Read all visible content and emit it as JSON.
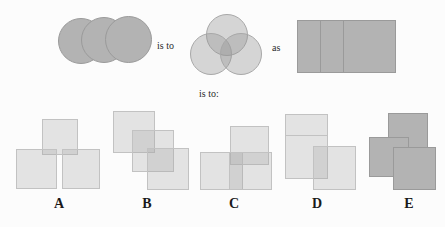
{
  "puzzle": {
    "kind": "visual-analogy",
    "connectives": {
      "is_to_1": "is to",
      "as": "as",
      "is_to_2": "is to:"
    },
    "colors": {
      "background": "#fcfcfc",
      "shape_opaque_fill": "#b3b3b3",
      "shape_opaque_stroke": "#9a9a9a",
      "shape_translucent_fill": "rgba(150,150,150,0.38)",
      "shape_translucent_stroke": "#a8a8a8",
      "shape_light_fill": "rgba(170,170,170,0.30)",
      "shape_light_stroke": "#c2c2c2",
      "label_text": "#1a1a1a",
      "word_text": "#2b2b2b"
    },
    "prompt": {
      "term_a": {
        "name": "three-opaque-overlapping-circles",
        "description": "Three solid gray circles overlapping left to right in a row",
        "shape": "circle",
        "count": 3,
        "style": "opaque",
        "arrangement": "horizontal-row-overlap"
      },
      "term_b": {
        "name": "three-translucent-venn-circles",
        "description": "Three translucent circles in a Venn diagram arrangement",
        "shape": "circle",
        "count": 3,
        "style": "translucent",
        "arrangement": "venn-triad"
      },
      "term_c": {
        "name": "three-opaque-overlapping-squares",
        "description": "Three solid gray squares overlapping left to right in a row",
        "shape": "square",
        "count": 3,
        "style": "opaque",
        "arrangement": "horizontal-row-overlap"
      }
    },
    "options": [
      {
        "label": "A",
        "name": "option-a",
        "description": "Three light squares: one centered above, two below left and right, corners overlapping",
        "shape": "square",
        "count": 3,
        "style": "light",
        "arrangement": "pyramid-triad"
      },
      {
        "label": "B",
        "name": "option-b",
        "description": "Three light squares cascading diagonally down to the right",
        "shape": "square",
        "count": 3,
        "style": "light",
        "arrangement": "diagonal-cascade"
      },
      {
        "label": "C",
        "name": "option-c",
        "description": "Three light squares: one raised upper right, two overlapping below",
        "shape": "square",
        "count": 3,
        "style": "light",
        "arrangement": "offset-cluster"
      },
      {
        "label": "D",
        "name": "option-d",
        "description": "Two stacked light squares on the left with a third overlapping at lower right",
        "shape": "square",
        "count": 3,
        "style": "light",
        "arrangement": "stacked-plus-offset"
      },
      {
        "label": "E",
        "name": "option-e",
        "description": "Three opaque gray squares cascading diagonally down to the right",
        "shape": "square",
        "count": 3,
        "style": "opaque",
        "arrangement": "diagonal-cascade"
      }
    ]
  }
}
